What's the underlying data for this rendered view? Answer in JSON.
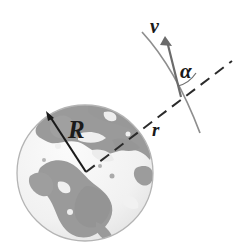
{
  "figure": {
    "background_color": "#ffffff",
    "width": 245,
    "height": 252,
    "labels": {
      "earth_radius": "R",
      "orbit_radius": "r",
      "velocity": "v",
      "angle": "α"
    },
    "colors": {
      "ink": "#1a1a1a",
      "land": "#9a9a9a",
      "ocean": "#f2f2f2",
      "globe_outline": "#b4b4b4",
      "dashed": "#2b2b2b",
      "arc": "#8e8e8e",
      "vector": "#6b6b6b"
    },
    "geometry": {
      "globe_center_x": 85,
      "globe_center_y": 173,
      "globe_radius": 68,
      "radius_arrow_tip_x": 46,
      "radius_arrow_tip_y": 112,
      "dashed_line_end_x": 232,
      "dashed_line_end_y": 61,
      "velocity_arrow_tip_x": 165,
      "velocity_arrow_tip_y": 37,
      "velocity_arrow_tail_x": 181,
      "velocity_arrow_tail_y": 97,
      "orbit_arc_start_x": 142,
      "orbit_arc_start_y": 32,
      "orbit_arc_end_x": 200,
      "orbit_arc_end_y": 133
    },
    "elements": {
      "globe_name": "earth-globe",
      "radius_vector_name": "earth-radius-arrow",
      "orbit_radius_line_name": "orbit-radius-dashed-line",
      "orbit_arc_name": "orbit-path-arc",
      "velocity_vector_name": "velocity-arrow",
      "angle_marker_name": "angle-alpha-marker"
    }
  }
}
